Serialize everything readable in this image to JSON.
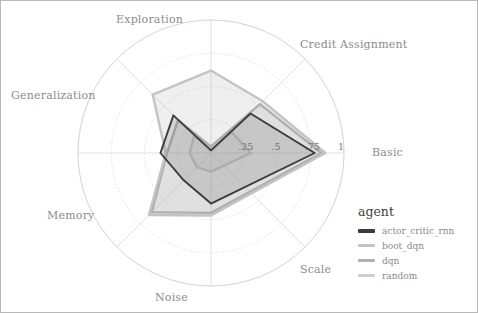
{
  "figure": {
    "background": "#ffffff",
    "border_color": "#b9b9b9",
    "grid_color": "#d8d8d8",
    "label_color": "#8c8c8c"
  },
  "legend": {
    "title": "agent",
    "entries": [
      {
        "label": "actor_critic_rnn",
        "color": "#3b3b3b"
      },
      {
        "label": "boot_dqn",
        "color": "#c3c3c3"
      },
      {
        "label": "dqn",
        "color": "#b0b0b0"
      },
      {
        "label": "random",
        "color": "#cccccc"
      }
    ]
  },
  "chart_data": {
    "type": "radar",
    "title": "",
    "center": {
      "x": 210,
      "y": 152
    },
    "radius_px": 133,
    "rlim": [
      0,
      1
    ],
    "grid": true,
    "legend_position": "right",
    "legend_title": "agent",
    "radial_ticks": [
      {
        "value": 0.25,
        "label": ".25"
      },
      {
        "value": 0.5,
        "label": ".5"
      },
      {
        "value": 0.75,
        "label": ".75"
      },
      {
        "value": 1.0,
        "label": "1"
      }
    ],
    "categories": [
      "Basic",
      "Credit Assignment",
      "Exploration",
      "Generalization",
      "Memory",
      "Noise",
      "Scale"
    ],
    "angles_deg": [
      0,
      45,
      90,
      135,
      180,
      225,
      270
    ],
    "series": [
      {
        "name": "actor_critic_rnn",
        "color": "#3b3b3b",
        "fill": "rgba(90,90,90,0.18)",
        "values": [
          0.78,
          0.42,
          0.02,
          0.4,
          0.38,
          0.29,
          0.38
        ]
      },
      {
        "name": "boot_dqn",
        "color": "#c3c3c3",
        "fill": "rgba(175,175,175,0.20)",
        "values": [
          0.86,
          0.55,
          0.62,
          0.62,
          0.34,
          0.66,
          0.47
        ]
      },
      {
        "name": "dqn",
        "color": "#b0b0b0",
        "fill": "rgba(165,165,165,0.20)",
        "values": [
          0.83,
          0.52,
          0.05,
          0.35,
          0.33,
          0.63,
          0.45
        ]
      },
      {
        "name": "random",
        "color": "#cccccc",
        "fill": "rgba(200,200,200,0.18)",
        "values": [
          0.3,
          0.22,
          0.03,
          0.18,
          0.16,
          0.15,
          0.14
        ]
      }
    ],
    "axis_labels": [
      {
        "text": "Basic",
        "x": 371,
        "y": 145
      },
      {
        "text": "Credit Assignment",
        "x": 299,
        "y": 37
      },
      {
        "text": "Exploration",
        "x": 115,
        "y": 12
      },
      {
        "text": "Generalization",
        "x": 10,
        "y": 88
      },
      {
        "text": "Memory",
        "x": 46,
        "y": 208
      },
      {
        "text": "Noise",
        "x": 154,
        "y": 290
      },
      {
        "text": "Scale",
        "x": 299,
        "y": 262
      }
    ]
  }
}
